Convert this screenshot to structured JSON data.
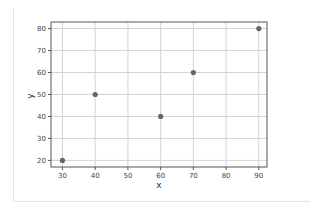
{
  "chart_data": {
    "type": "scatter",
    "title": "",
    "xlabel": "x",
    "ylabel": "y",
    "x": [
      30,
      40,
      60,
      70,
      90
    ],
    "y": [
      20,
      50,
      40,
      60,
      80
    ],
    "xticks": [
      30,
      40,
      50,
      60,
      70,
      80,
      90
    ],
    "yticks": [
      20,
      30,
      40,
      50,
      60,
      70,
      80
    ],
    "xlim": [
      26.5,
      92.5
    ],
    "ylim": [
      17,
      83
    ],
    "grid": true,
    "legend": null,
    "marker_color": "#666666"
  },
  "labels": {
    "xlabel": "x",
    "ylabel": "y"
  }
}
